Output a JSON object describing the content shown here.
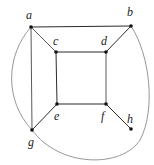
{
  "diagram": {
    "type": "graph",
    "vertices": [
      {
        "id": "a",
        "label": "a",
        "x": 31,
        "y": 27,
        "lx": 26,
        "ly": 19
      },
      {
        "id": "b",
        "label": "b",
        "x": 131,
        "y": 26,
        "lx": 127,
        "ly": 16
      },
      {
        "id": "c",
        "label": "c",
        "x": 56,
        "y": 52,
        "lx": 53,
        "ly": 45
      },
      {
        "id": "d",
        "label": "d",
        "x": 106,
        "y": 52,
        "lx": 101,
        "ly": 45
      },
      {
        "id": "e",
        "label": "e",
        "x": 57,
        "y": 104,
        "lx": 54,
        "ly": 120
      },
      {
        "id": "f",
        "label": "f",
        "x": 106,
        "y": 104,
        "lx": 101,
        "ly": 120
      },
      {
        "id": "g",
        "label": "g",
        "x": 32,
        "y": 130,
        "lx": 28,
        "ly": 146
      },
      {
        "id": "h",
        "label": "h",
        "x": 131,
        "y": 129,
        "lx": 127,
        "ly": 123
      }
    ],
    "edges": [
      {
        "from": "a",
        "to": "b",
        "style": "straight"
      },
      {
        "from": "a",
        "to": "c",
        "style": "straight"
      },
      {
        "from": "a",
        "to": "g",
        "style": "straight"
      },
      {
        "from": "b",
        "to": "d",
        "style": "straight"
      },
      {
        "from": "c",
        "to": "d",
        "style": "straight"
      },
      {
        "from": "c",
        "to": "e",
        "style": "straight"
      },
      {
        "from": "d",
        "to": "f",
        "style": "straight"
      },
      {
        "from": "e",
        "to": "f",
        "style": "straight"
      },
      {
        "from": "e",
        "to": "g",
        "style": "straight"
      },
      {
        "from": "f",
        "to": "h",
        "style": "straight"
      },
      {
        "from": "a",
        "to": "g",
        "style": "curved-left"
      },
      {
        "from": "b",
        "to": "g",
        "style": "curved-around-right-bottom"
      }
    ],
    "colors": {
      "edge": "#2b2b2b",
      "curve": "#8a8a8a",
      "vertex": "#111111",
      "label": "#222222"
    }
  }
}
